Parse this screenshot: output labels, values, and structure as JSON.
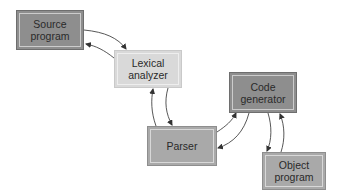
{
  "diagram": {
    "nodes": [
      {
        "id": "source",
        "label_line1": "Source",
        "label_line2": "program",
        "shade": "dark"
      },
      {
        "id": "lexical",
        "label_line1": "Lexical",
        "label_line2": "analyzer",
        "shade": "light"
      },
      {
        "id": "parser",
        "label_line1": "Parser",
        "label_line2": "",
        "shade": "medium"
      },
      {
        "id": "codegen",
        "label_line1": "Code",
        "label_line2": "generator",
        "shade": "dark"
      },
      {
        "id": "object",
        "label_line1": "Object",
        "label_line2": "program",
        "shade": "medium"
      }
    ],
    "edges": [
      {
        "from": "source",
        "to": "lexical"
      },
      {
        "from": "lexical",
        "to": "source"
      },
      {
        "from": "lexical",
        "to": "parser"
      },
      {
        "from": "parser",
        "to": "lexical"
      },
      {
        "from": "parser",
        "to": "codegen"
      },
      {
        "from": "codegen",
        "to": "parser"
      },
      {
        "from": "codegen",
        "to": "object"
      },
      {
        "from": "object",
        "to": "codegen"
      }
    ],
    "colors": {
      "dark": "#8e8e8e",
      "light": "#d9d9d9",
      "medium": "#a9a9a9",
      "arrow": "#333333"
    }
  }
}
